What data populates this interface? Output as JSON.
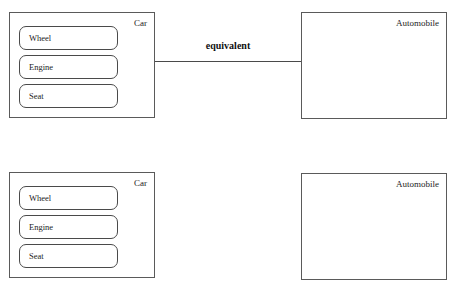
{
  "diagram": {
    "connector": {
      "label": "equivalent",
      "color": "#4a4a4a"
    },
    "rows": [
      {
        "id": "row-top",
        "has_connector": true,
        "left_box": {
          "title": "Car",
          "parts": [
            {
              "label": "Wheel"
            },
            {
              "label": "Engine"
            },
            {
              "label": "Seat"
            }
          ]
        },
        "right_box": {
          "title": "Automobile",
          "parts": []
        }
      },
      {
        "id": "row-bottom",
        "has_connector": false,
        "left_box": {
          "title": "Car",
          "parts": [
            {
              "label": "Wheel"
            },
            {
              "label": "Engine"
            },
            {
              "label": "Seat"
            }
          ]
        },
        "right_box": {
          "title": "Automobile",
          "parts": []
        }
      }
    ],
    "colors": {
      "box_border": "#5a5a5a",
      "part_border": "#4a4a4a",
      "text": "#1c1c1c",
      "background": "#ffffff"
    }
  }
}
